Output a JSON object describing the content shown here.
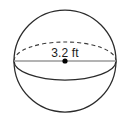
{
  "figure": {
    "type": "sphere-diagram",
    "shape_name": "sphere",
    "background_color": "#ffffff",
    "outline_color": "#2b2b2b",
    "equator_dashed_color": "#3a3a3a",
    "equator_solid_color": "#2b2b2b",
    "diameter_line_color": "#9a9a9a",
    "center_dot_color": "#000000",
    "label_color": "#1b1b1b",
    "diameter_label": "3.2 ft",
    "measurement": {
      "value": "3.2",
      "unit": "ft",
      "quantity": "diameter"
    },
    "geometry": {
      "center_x": 65,
      "center_y": 61,
      "radius": 51,
      "equator_rx": 51,
      "equator_ry": 19,
      "center_dot_radius": 2.6,
      "dash_pattern": "4 3"
    }
  }
}
